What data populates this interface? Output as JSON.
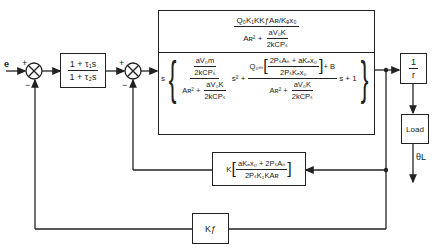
{
  "input": {
    "label": "e"
  },
  "sum1": {
    "plus": "+",
    "minus": "−"
  },
  "sum2": {
    "plus": "+",
    "minus": "−"
  },
  "leadlag": {
    "num": "1 + τ₁s",
    "den": "1 + τ₂s"
  },
  "plant": {
    "gain_num": "Q₀K₁KKƒAʀ/Kₑx₀",
    "gain_den_A": "Aʀ² +",
    "gain_den_frac_num": "aV₀K",
    "gain_den_frac_den": "2kCPₛ",
    "s_prefix": "s",
    "t1_num_num": "aV₀m",
    "t1_num_den": "2kCPₛ",
    "t1_den_A": "Aʀ² +",
    "t1_den_frac_num": "aV₀K",
    "t1_den_frac_den": "2kCPₛ",
    "s2": "s² +",
    "t2_Q": "Q₀ₘ",
    "t2_inner_num": "2PₛAₙ + aKₑx₀",
    "t2_inner_den": "2PₛKₑx₀",
    "t2_plusB": "+ B",
    "t2_den_A": "Aʀ² +",
    "t2_den_frac_num": "aV₀K",
    "t2_den_frac_den": "2kCPₛ",
    "s_plus_1": "s + 1"
  },
  "inv_r": {
    "num": "1",
    "den": "r"
  },
  "load": {
    "label": "Load"
  },
  "output": {
    "label": "θL"
  },
  "mid_feedback": {
    "K": "K",
    "num": "aKₑx₀ + 2PₛAₙ",
    "den": "2PₛK₁KAʀ"
  },
  "outer_feedback": {
    "label": "Kƒ"
  }
}
